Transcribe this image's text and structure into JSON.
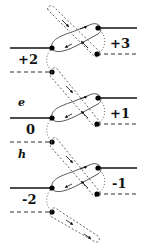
{
  "diagram": {
    "labels": {
      "plus3": "+3",
      "plus2": "+2",
      "e": "e",
      "plus1": "+1",
      "zero": "0",
      "h": "h",
      "minus1": "-1",
      "minus2": "-2"
    },
    "colors": {
      "line": "#111111",
      "dashed": "#333333",
      "dotted": "#555555",
      "node": "#000000"
    },
    "units": [
      {
        "left_y": 48,
        "right_y": 28,
        "lr_y": 54,
        "ll_y": 72
      },
      {
        "left_y": 118,
        "right_y": 98,
        "lr_y": 124,
        "ll_y": 142
      },
      {
        "left_y": 188,
        "right_y": 168,
        "lr_y": 194,
        "ll_y": 212
      }
    ]
  }
}
